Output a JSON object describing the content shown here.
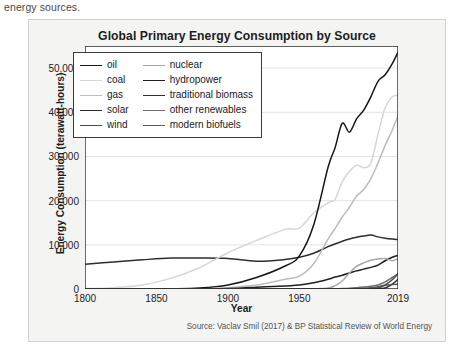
{
  "page": {
    "intro_text": "energy sources."
  },
  "card": {
    "title": "Global Primary Energy Consumption by Source",
    "source_note": "Source: Vaclav Smil (2017) & BP Statistical Review of World Energy"
  },
  "axes": {
    "x_title": "Year",
    "y_title": "Energy Consumption (terawatt-hours)",
    "x_ticks": [
      "1800",
      "1850",
      "1900",
      "1950",
      "2019"
    ],
    "y_ticks": [
      "0",
      "10,000",
      "20,000",
      "30,000",
      "40,000",
      "50,000"
    ]
  },
  "legend": {
    "entries": [
      {
        "label": "oil",
        "color": "#161616"
      },
      {
        "label": "nuclear",
        "color": "#a8a8a8"
      },
      {
        "label": "coal",
        "color": "#d6d6d6"
      },
      {
        "label": "hydropower",
        "color": "#1f1f1f"
      },
      {
        "label": "gas",
        "color": "#bcbcbc"
      },
      {
        "label": "traditional biomass",
        "color": "#2e2e2e"
      },
      {
        "label": "solar",
        "color": "#2a2a2a"
      },
      {
        "label": "other renewables",
        "color": "#6e6e6e"
      },
      {
        "label": "wind",
        "color": "#4a4a4a"
      },
      {
        "label": "modern biofuels",
        "color": "#5a5a5a"
      }
    ]
  },
  "chart_data": {
    "type": "line",
    "title": "Global Primary Energy Consumption by Source",
    "xlabel": "Year",
    "ylabel": "Energy Consumption (terawatt-hours)",
    "xlim": [
      1800,
      2019
    ],
    "ylim": [
      0,
      55000
    ],
    "grid": true,
    "legend_position": "upper-left-inside",
    "x": [
      1800,
      1820,
      1840,
      1860,
      1880,
      1900,
      1920,
      1940,
      1950,
      1960,
      1970,
      1975,
      1980,
      1985,
      1990,
      1995,
      2000,
      2005,
      2010,
      2015,
      2019
    ],
    "series": [
      {
        "name": "traditional biomass",
        "color": "#2e2e2e",
        "values": [
          5600,
          6100,
          6600,
          7000,
          7000,
          6900,
          6300,
          6700,
          7200,
          8100,
          9600,
          10200,
          10800,
          11300,
          11700,
          12000,
          12200,
          11800,
          11500,
          11300,
          11200
        ]
      },
      {
        "name": "coal",
        "color": "#d6d6d6",
        "values": [
          100,
          300,
          900,
          2400,
          4800,
          8200,
          11000,
          13500,
          13800,
          17200,
          19500,
          20300,
          24300,
          26600,
          28000,
          27500,
          28500,
          35000,
          41000,
          43500,
          43800
        ]
      },
      {
        "name": "oil",
        "color": "#161616",
        "values": [
          0,
          0,
          0,
          30,
          200,
          900,
          2600,
          5200,
          7500,
          14500,
          27500,
          32000,
          37500,
          35500,
          38500,
          40500,
          43500,
          47000,
          48500,
          51000,
          53600
        ]
      },
      {
        "name": "gas",
        "color": "#bcbcbc",
        "values": [
          0,
          0,
          0,
          0,
          50,
          300,
          900,
          2200,
          2900,
          5700,
          11300,
          13700,
          16300,
          18500,
          21000,
          22500,
          25000,
          28500,
          32500,
          36000,
          39300
        ]
      },
      {
        "name": "hydropower",
        "color": "#1f1f1f",
        "values": [
          0,
          0,
          0,
          0,
          10,
          120,
          380,
          700,
          900,
          1400,
          2200,
          2700,
          3100,
          3600,
          4100,
          4500,
          4900,
          5400,
          6400,
          7200,
          7600
        ]
      },
      {
        "name": "nuclear",
        "color": "#a8a8a8",
        "values": [
          0,
          0,
          0,
          0,
          0,
          0,
          0,
          0,
          0,
          30,
          210,
          760,
          1800,
          3600,
          5100,
          5900,
          6500,
          6800,
          6900,
          6400,
          6900
        ]
      },
      {
        "name": "other renewables",
        "color": "#6e6e6e",
        "values": [
          0,
          0,
          0,
          0,
          0,
          0,
          0,
          0,
          0,
          0,
          30,
          60,
          110,
          180,
          290,
          430,
          620,
          900,
          1600,
          2600,
          3400
        ]
      },
      {
        "name": "wind",
        "color": "#4a4a4a",
        "values": [
          0,
          0,
          0,
          0,
          0,
          0,
          0,
          0,
          0,
          0,
          0,
          0,
          0,
          10,
          20,
          50,
          90,
          260,
          900,
          2100,
          3500
        ]
      },
      {
        "name": "solar",
        "color": "#2a2a2a",
        "values": [
          0,
          0,
          0,
          0,
          0,
          0,
          0,
          0,
          0,
          0,
          0,
          0,
          0,
          0,
          5,
          10,
          20,
          60,
          230,
          1100,
          2200
        ]
      },
      {
        "name": "modern biofuels",
        "color": "#5a5a5a",
        "values": [
          0,
          0,
          0,
          0,
          0,
          0,
          0,
          0,
          0,
          0,
          0,
          0,
          20,
          60,
          110,
          180,
          280,
          520,
          830,
          1000,
          1100
        ]
      }
    ]
  }
}
